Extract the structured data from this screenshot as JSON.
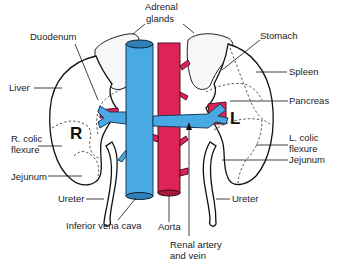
{
  "diagram": {
    "kidney_markers": {
      "right": "R",
      "left": "L"
    },
    "labels": {
      "adrenal_line1": "Adrenal",
      "adrenal_line2": "glands",
      "duodenum": "Duodenum",
      "stomach": "Stomach",
      "liver": "Liver",
      "spleen": "Spleen",
      "pancreas": "Pancreas",
      "r_colic_line1": "R. colic",
      "r_colic_line2": "flexure",
      "l_colic_line1": "L. colic",
      "l_colic_line2": "flexure",
      "jejunum_left": "Jejunum",
      "jejunum_right": "Jejunum",
      "ureter_left": "Ureter",
      "ureter_right": "Ureter",
      "ivc": "Inferior vena cava",
      "aorta": "Aorta",
      "renal_line1": "Renal artery",
      "renal_line2": "and vein"
    },
    "colors": {
      "vein": "#49a9e3",
      "artery": "#dc2456",
      "outline": "#111111",
      "background": "#ffffff"
    }
  }
}
